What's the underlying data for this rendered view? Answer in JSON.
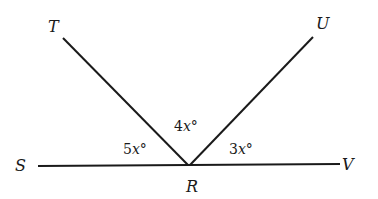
{
  "diagram": {
    "points": {
      "T": {
        "label": "T"
      },
      "U": {
        "label": "U"
      },
      "S": {
        "label": "S"
      },
      "V": {
        "label": "V"
      },
      "R": {
        "label": "R"
      }
    },
    "angles": [
      {
        "name": "angle-SRT",
        "coef": "5",
        "var": "x",
        "unit": "°"
      },
      {
        "name": "angle-TRU",
        "coef": "4",
        "var": "x",
        "unit": "°"
      },
      {
        "name": "angle-URV",
        "coef": "3",
        "var": "x",
        "unit": "°"
      }
    ],
    "line_color": "#1a1a1a"
  }
}
